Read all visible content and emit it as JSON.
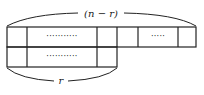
{
  "diagram": {
    "top_brace_label": "(n − r)",
    "bottom_brace_label": "r",
    "top_row": {
      "cells": [
        "",
        "···········",
        "",
        "",
        "·····",
        ""
      ]
    },
    "bottom_row": {
      "cells": [
        "",
        "···········",
        ""
      ]
    },
    "colors": {
      "stroke": "#222222",
      "background": "#ffffff"
    }
  }
}
